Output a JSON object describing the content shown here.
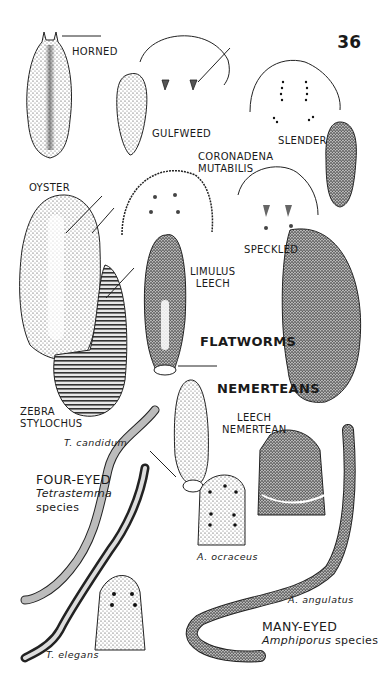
{
  "page": {
    "number": "36",
    "background": "#ffffff",
    "ink": "#1a1a1a"
  },
  "section_headings": {
    "flatworms": "FLATWORMS",
    "nemerteans": "NEMERTEANS"
  },
  "flatworms": [
    {
      "label": "HORNED"
    },
    {
      "label": "GULFWEED"
    },
    {
      "label": "SLENDER"
    },
    {
      "label_line1": "CORONADENA",
      "label_line2": "MUTABILIS"
    },
    {
      "label": "OYSTER"
    },
    {
      "label": "SPECKLED"
    },
    {
      "label_line1": "LIMULUS",
      "label_line2": "LEECH"
    },
    {
      "label_line1": "ZEBRA",
      "label_line2": "STYLOCHUS"
    }
  ],
  "nemerteans": {
    "leech_nemertean": {
      "label_line1": "LEECH",
      "label_line2": "NEMERTEAN"
    },
    "four_eyed": {
      "label": "FOUR-EYED",
      "scientific_line1": "Tetrastemma",
      "scientific_line2": "species",
      "species": [
        "T. candidum",
        "T. elegans"
      ]
    },
    "many_eyed": {
      "label": "MANY-EYED",
      "scientific": "Amphiporus",
      "scientific_suffix": "species",
      "species": [
        "A. ocraceus",
        "A. angulatus"
      ]
    }
  }
}
